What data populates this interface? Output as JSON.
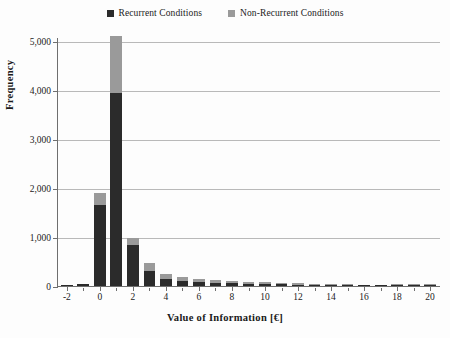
{
  "legend": {
    "items": [
      {
        "label": "Recurrent Conditions",
        "color": "#2b2b2b",
        "key": "recurrent"
      },
      {
        "label": "Non-Recurrent Conditions",
        "color": "#9a9a9a",
        "key": "non_recurrent"
      }
    ]
  },
  "colors": {
    "recurrent": "#2b2b2b",
    "non_recurrent": "#9a9a9a",
    "grid": "#b9b9b9",
    "axis": "#6f6f6f",
    "background": "#fdfdfd"
  },
  "chart_data": {
    "type": "bar",
    "title": "",
    "subtitle": "",
    "xlabel": "Value of Information [€]",
    "ylabel": "Frequency",
    "stacked": true,
    "grid": true,
    "legend_position": "top-center",
    "xlim": [
      -2.6,
      20.6
    ],
    "ylim": [
      0,
      5000
    ],
    "xticks": [
      -2,
      0,
      2,
      4,
      6,
      8,
      10,
      12,
      14,
      16,
      18,
      20
    ],
    "xtick_labels": [
      "-2",
      "0",
      "2",
      "4",
      "6",
      "8",
      "10",
      "12",
      "14",
      "16",
      "18",
      "20"
    ],
    "yticks": [
      0,
      1000,
      2000,
      3000,
      4000,
      5000
    ],
    "ytick_labels": [
      "0",
      "1,000",
      "2,000",
      "3,000",
      "4,000",
      "5,000"
    ],
    "x": [
      -2,
      -1,
      0,
      1,
      2,
      3,
      4,
      5,
      6,
      7,
      8,
      9,
      10,
      11,
      12,
      13,
      14,
      15,
      16,
      17,
      18,
      19,
      20
    ],
    "series": [
      {
        "name": "Recurrent Conditions",
        "color": "#2b2b2b",
        "values": [
          20,
          35,
          1650,
          3940,
          840,
          300,
          150,
          110,
          85,
          70,
          55,
          45,
          40,
          35,
          30,
          25,
          22,
          18,
          15,
          12,
          30,
          28,
          25
        ]
      },
      {
        "name": "Non-Recurrent Conditions",
        "color": "#9a9a9a",
        "values": [
          10,
          15,
          240,
          1160,
          140,
          180,
          90,
          80,
          65,
          55,
          45,
          40,
          35,
          30,
          25,
          22,
          18,
          15,
          12,
          10,
          15,
          12,
          10
        ]
      }
    ],
    "totals": [
      30,
      50,
      1890,
      5100,
      980,
      480,
      240,
      190,
      150,
      125,
      100,
      85,
      75,
      65,
      55,
      47,
      40,
      33,
      27,
      22,
      45,
      40,
      35
    ]
  }
}
